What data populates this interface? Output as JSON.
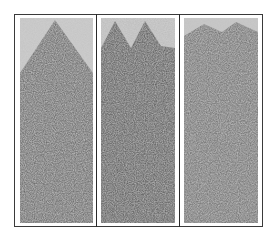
{
  "figure": {
    "panel_count": 3,
    "panels": [
      {
        "id": "panel-1",
        "shape": "single-peak",
        "seed": 3
      },
      {
        "id": "panel-2",
        "shape": "double-peak",
        "seed": 7
      },
      {
        "id": "panel-3",
        "shape": "diffuse",
        "seed": 11
      }
    ],
    "colors": {
      "background_texture": "#c8c8c8",
      "dense_region": "#5a5a5a",
      "frame": "#3a3a3a"
    }
  }
}
